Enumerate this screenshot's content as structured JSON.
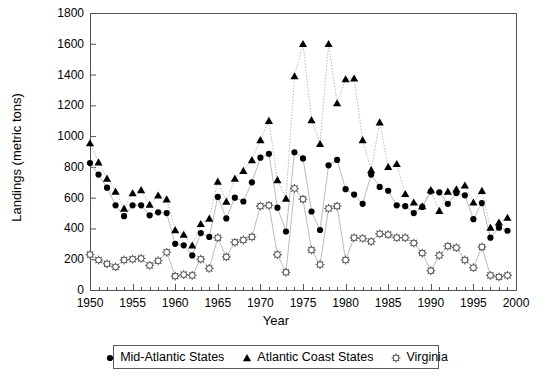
{
  "chart_data": {
    "type": "scatter",
    "title": "",
    "xlabel": "Year",
    "ylabel": "Landings (metric tons)",
    "xlim": [
      1950,
      2000
    ],
    "ylim": [
      0,
      1800
    ],
    "ytick_step": 200,
    "xtick_step": 5,
    "grid": false,
    "legend_position": "bottom",
    "yticks": [
      0,
      200,
      400,
      600,
      800,
      1000,
      1200,
      1400,
      1600,
      1800
    ],
    "xticks": [
      1950,
      1955,
      1960,
      1965,
      1970,
      1975,
      1980,
      1985,
      1990,
      1995,
      2000
    ],
    "x": [
      1950,
      1951,
      1952,
      1953,
      1954,
      1955,
      1956,
      1957,
      1958,
      1959,
      1960,
      1961,
      1962,
      1963,
      1964,
      1965,
      1966,
      1967,
      1968,
      1969,
      1970,
      1971,
      1972,
      1973,
      1974,
      1975,
      1976,
      1977,
      1978,
      1979,
      1980,
      1981,
      1982,
      1983,
      1984,
      1985,
      1986,
      1987,
      1988,
      1989,
      1990,
      1991,
      1992,
      1993,
      1994,
      1995,
      1996,
      1997,
      1998,
      1999
    ],
    "series": [
      {
        "name": "Mid-Atlantic States",
        "marker": "circle",
        "color": "#000000",
        "values": [
          825,
          750,
          665,
          550,
          480,
          550,
          550,
          485,
          505,
          500,
          300,
          290,
          225,
          370,
          345,
          605,
          465,
          600,
          575,
          700,
          860,
          885,
          535,
          380,
          895,
          855,
          510,
          390,
          810,
          845,
          655,
          620,
          560,
          750,
          670,
          645,
          550,
          545,
          500,
          540,
          640,
          635,
          560,
          630,
          615,
          460,
          565,
          340,
          405,
          385
        ]
      },
      {
        "name": "Atlantic Coast States",
        "marker": "triangle",
        "color": "#000000",
        "values": [
          955,
          830,
          725,
          640,
          530,
          630,
          650,
          555,
          615,
          590,
          390,
          360,
          290,
          430,
          465,
          705,
          575,
          725,
          775,
          845,
          975,
          1100,
          715,
          595,
          1390,
          1600,
          1105,
          950,
          1600,
          1215,
          1370,
          1375,
          975,
          780,
          1090,
          800,
          820,
          625,
          570,
          545,
          650,
          515,
          640,
          655,
          680,
          570,
          645,
          405,
          440,
          470
        ]
      },
      {
        "name": "Virginia",
        "marker": "star",
        "color": "#666666",
        "values": [
          230,
          195,
          170,
          150,
          195,
          200,
          205,
          160,
          190,
          245,
          90,
          100,
          95,
          200,
          140,
          340,
          215,
          310,
          325,
          345,
          545,
          550,
          230,
          115,
          660,
          590,
          260,
          165,
          530,
          545,
          195,
          340,
          335,
          315,
          365,
          360,
          340,
          340,
          305,
          240,
          125,
          225,
          285,
          275,
          195,
          145,
          280,
          95,
          85,
          95
        ]
      }
    ]
  },
  "axes": {
    "ytick_labels": [
      "1800",
      "1600",
      "1400",
      "1200",
      "1000",
      "800",
      "600",
      "400",
      "200",
      "0"
    ],
    "xtick_labels": [
      "1950",
      "1955",
      "1960",
      "1965",
      "1970",
      "1975",
      "1980",
      "1985",
      "1990",
      "1995",
      "2000"
    ]
  },
  "legend": {
    "items": [
      {
        "label": "Mid-Atlantic States",
        "marker": "circle"
      },
      {
        "label": "Atlantic Coast States",
        "marker": "triangle"
      },
      {
        "label": "Virginia",
        "marker": "star"
      }
    ]
  }
}
